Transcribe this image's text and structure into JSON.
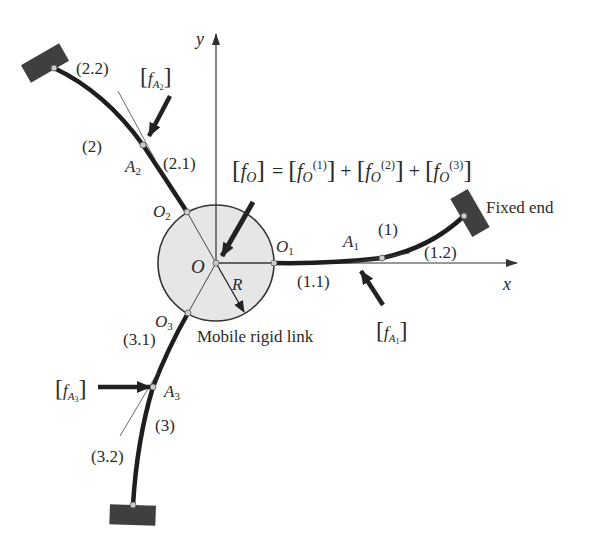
{
  "diagram": {
    "type": "mechanism schematic",
    "colors": {
      "background": "#ffffff",
      "beam": "#1e1e1e",
      "link_fill": "#e6e6e6",
      "fixed_block": "#3f3f3f",
      "line": "#333333",
      "text": "#2a2a2a"
    },
    "axes": {
      "x_label": "x",
      "y_label": "y"
    },
    "center": {
      "label": "O",
      "radius_label": "R",
      "link_label": "Mobile rigid link"
    },
    "equation": {
      "lhs": "f",
      "lhs_sub": "O",
      "terms": [
        {
          "base": "f",
          "sub": "O",
          "sup": "(1)"
        },
        {
          "base": "f",
          "sub": "O",
          "sup": "(2)"
        },
        {
          "base": "f",
          "sub": "O",
          "sup": "(3)"
        }
      ],
      "equals": "=",
      "plus": "+"
    },
    "fixed_end_label": "Fixed end",
    "beams": [
      {
        "id": "(1)",
        "attach_point": {
          "base": "O",
          "sub": "1"
        },
        "load_point": {
          "base": "A",
          "sub": "1"
        },
        "segments": [
          "(1.1)",
          "(1.2)"
        ],
        "force": {
          "base": "f",
          "sub": "A",
          "subsub": "1"
        }
      },
      {
        "id": "(2)",
        "attach_point": {
          "base": "O",
          "sub": "2"
        },
        "load_point": {
          "base": "A",
          "sub": "2"
        },
        "segments": [
          "(2.1)",
          "(2.2)"
        ],
        "force": {
          "base": "f",
          "sub": "A",
          "subsub": "2"
        }
      },
      {
        "id": "(3)",
        "attach_point": {
          "base": "O",
          "sub": "3"
        },
        "load_point": {
          "base": "A",
          "sub": "3"
        },
        "segments": [
          "(3.1)",
          "(3.2)"
        ],
        "force": {
          "base": "f",
          "sub": "A",
          "subsub": "3"
        }
      }
    ]
  }
}
